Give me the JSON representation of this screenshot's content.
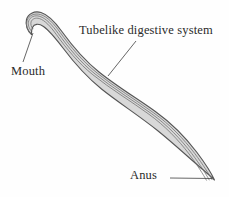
{
  "figure": {
    "background_color": "#fefefe",
    "body_fill_color": "#d8d8d8",
    "body_outline_color": "#555555",
    "tube_line_color": "#6e6e6e",
    "leader_line_color": "#4a4a4a",
    "text_color": "#2b2b2b"
  },
  "labels": {
    "digestive_system": "Tubelike digestive system",
    "mouth": "Mouth",
    "anus": "Anus"
  },
  "annotations": [
    {
      "name": "digestive-system",
      "text": "Tubelike digestive system",
      "text_position": {
        "x": 79,
        "y": 23
      },
      "leader_from": {
        "x": 136,
        "y": 41
      },
      "leader_to": {
        "x": 108,
        "y": 76
      }
    },
    {
      "name": "mouth",
      "text": "Mouth",
      "text_position": {
        "x": 11,
        "y": 64
      },
      "leader_from": {
        "x": 23,
        "y": 62
      },
      "leader_to": {
        "x": 33,
        "y": 33
      }
    },
    {
      "name": "anus",
      "text": "Anus",
      "text_position": {
        "x": 130,
        "y": 168
      },
      "leader_from": {
        "x": 170,
        "y": 178
      },
      "leader_to": {
        "x": 212,
        "y": 178
      }
    }
  ],
  "anatomy": {
    "mouth_tip": {
      "x": 31,
      "y": 34
    },
    "anus_tip": {
      "x": 214,
      "y": 180
    },
    "head_hook_apex": {
      "x": 24,
      "y": 14
    },
    "body_description": "Elongated S-curved nematode body with hooked anterior end at upper left and tapering posterior tip at lower right; shaded band between outer cuticle lines represents the tubelike digestive system running from mouth to anus."
  }
}
